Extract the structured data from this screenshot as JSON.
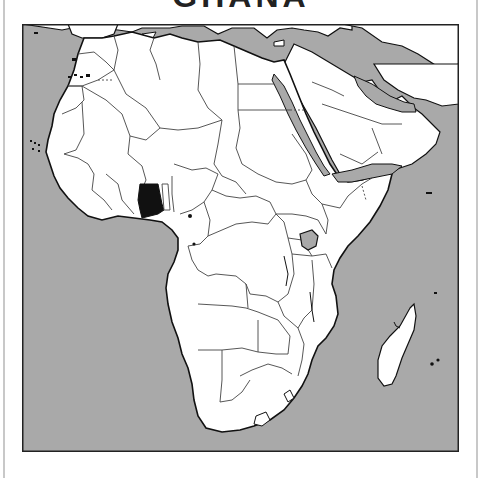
{
  "title": "GHANA",
  "map": {
    "region": "Africa",
    "highlighted_country": "Ghana",
    "colors": {
      "sea": "#a9a9a9",
      "land": "#ffffff",
      "border": "#444444",
      "coastline": "#111111",
      "highlight": "#111111",
      "frame": "#222222"
    },
    "features": [
      "africa-continent",
      "arabian-peninsula",
      "europe-south",
      "madagascar",
      "lake-victoria",
      "lesotho",
      "swaziland",
      "canary-islands",
      "cape-verde",
      "mascarene-islands",
      "comoros",
      "seychelles"
    ]
  }
}
